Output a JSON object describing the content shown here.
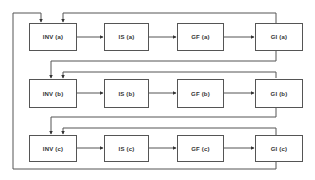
{
  "diagram": {
    "type": "block-flow",
    "line_color": "#555555",
    "rows": [
      {
        "id": "a",
        "nodes": [
          {
            "label": "INV (a)"
          },
          {
            "label": "IS (a)"
          },
          {
            "label": "GF (a)"
          },
          {
            "label": "GI (a)"
          }
        ]
      },
      {
        "id": "b",
        "nodes": [
          {
            "label": "INV (b)"
          },
          {
            "label": "IS (b)"
          },
          {
            "label": "GF (b)"
          },
          {
            "label": "GI (b)"
          }
        ]
      },
      {
        "id": "c",
        "nodes": [
          {
            "label": "INV (c)"
          },
          {
            "label": "IS (c)"
          },
          {
            "label": "GF (c)"
          },
          {
            "label": "GI (c)"
          }
        ]
      }
    ],
    "edges": [
      {
        "from": "INV (a)",
        "to": "IS (a)"
      },
      {
        "from": "IS (a)",
        "to": "GF (a)"
      },
      {
        "from": "GF (a)",
        "to": "GI (a)"
      },
      {
        "from": "GI (a)",
        "to": "INV (a)"
      },
      {
        "from": "GI (a)",
        "to": "INV (b)"
      },
      {
        "from": "INV (b)",
        "to": "IS (b)"
      },
      {
        "from": "IS (b)",
        "to": "GF (b)"
      },
      {
        "from": "GF (b)",
        "to": "GI (b)"
      },
      {
        "from": "GI (b)",
        "to": "INV (b)"
      },
      {
        "from": "GI (b)",
        "to": "INV (c)"
      },
      {
        "from": "INV (c)",
        "to": "IS (c)"
      },
      {
        "from": "IS (c)",
        "to": "GF (c)"
      },
      {
        "from": "GF (c)",
        "to": "GI (c)"
      },
      {
        "from": "GI (c)",
        "to": "INV (c)"
      },
      {
        "from": "GI (c)",
        "to": "INV (a)"
      }
    ]
  }
}
